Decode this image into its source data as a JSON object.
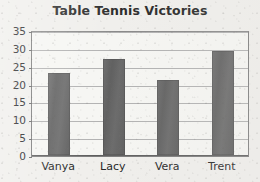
{
  "chart_data": {
    "type": "bar",
    "title": "Table Tennis Victories",
    "xlabel": "",
    "ylabel": "",
    "categories": [
      "Vanya",
      "Lacy",
      "Vera",
      "Trent"
    ],
    "values": [
      23,
      27,
      21,
      29
    ],
    "ylim": [
      0,
      35
    ],
    "ytick_labels": [
      "0",
      "5",
      "10",
      "15",
      "20",
      "25",
      "30",
      "35"
    ],
    "ytick_values": [
      0,
      5,
      10,
      15,
      20,
      25,
      30,
      35
    ],
    "grid": "horizontal",
    "legend": "none",
    "bar_color": "#666666",
    "gridline_color": "#b2b2b2",
    "axis_color": "#5e5e5e",
    "title_color": "#2b2b2b",
    "background_color": "#f0efec"
  }
}
